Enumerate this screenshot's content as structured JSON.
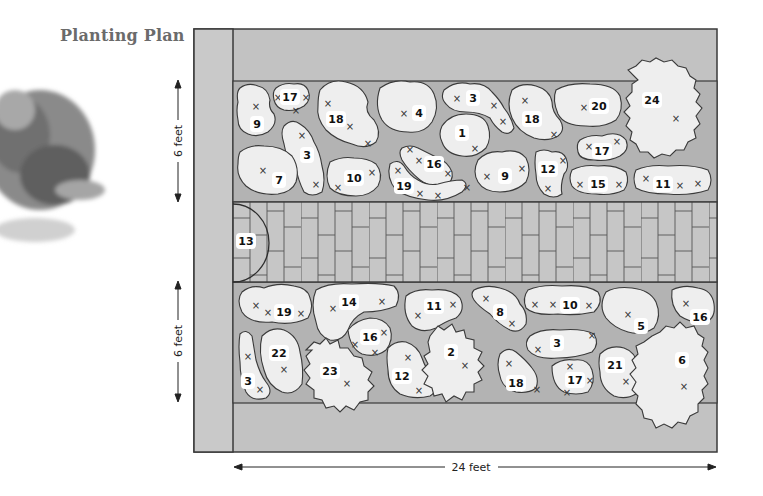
{
  "title": "Planting Plan",
  "colors": {
    "wall": "#c9c9c9",
    "bed_ground": "#b8b8b8",
    "lawn": "#c2c2c2",
    "path": "#c6c6c6",
    "plant_fill": "#eeeeee",
    "outline": "#3a3a3a",
    "title": "#6b6b6b"
  },
  "dimensions": {
    "upper_bed_depth": "6 feet",
    "lower_bed_depth": "6 feet",
    "total_length": "24 feet"
  },
  "path_feature": {
    "number": "13"
  },
  "upper_bed": {
    "plants": [
      {
        "number": "9",
        "x": 257,
        "y": 124
      },
      {
        "number": "17",
        "x": 290,
        "y": 97
      },
      {
        "number": "18",
        "x": 336,
        "y": 119
      },
      {
        "number": "4",
        "x": 419,
        "y": 113
      },
      {
        "number": "3",
        "x": 473,
        "y": 98
      },
      {
        "number": "1",
        "x": 462,
        "y": 133
      },
      {
        "number": "18",
        "x": 532,
        "y": 119
      },
      {
        "number": "20",
        "x": 599,
        "y": 106
      },
      {
        "number": "24",
        "x": 652,
        "y": 100
      },
      {
        "number": "3",
        "x": 307,
        "y": 155
      },
      {
        "number": "7",
        "x": 279,
        "y": 180
      },
      {
        "number": "10",
        "x": 354,
        "y": 178
      },
      {
        "number": "16",
        "x": 434,
        "y": 164
      },
      {
        "number": "19",
        "x": 404,
        "y": 186
      },
      {
        "number": "9",
        "x": 505,
        "y": 176
      },
      {
        "number": "12",
        "x": 548,
        "y": 169
      },
      {
        "number": "17",
        "x": 602,
        "y": 151
      },
      {
        "number": "15",
        "x": 598,
        "y": 184
      },
      {
        "number": "11",
        "x": 663,
        "y": 184
      }
    ]
  },
  "lower_bed": {
    "plants": [
      {
        "number": "19",
        "x": 284,
        "y": 312
      },
      {
        "number": "14",
        "x": 349,
        "y": 302
      },
      {
        "number": "11",
        "x": 434,
        "y": 306
      },
      {
        "number": "8",
        "x": 500,
        "y": 312
      },
      {
        "number": "10",
        "x": 570,
        "y": 305
      },
      {
        "number": "5",
        "x": 641,
        "y": 326
      },
      {
        "number": "16",
        "x": 700,
        "y": 317
      },
      {
        "number": "16",
        "x": 370,
        "y": 337
      },
      {
        "number": "22",
        "x": 279,
        "y": 353
      },
      {
        "number": "2",
        "x": 451,
        "y": 352
      },
      {
        "number": "3",
        "x": 557,
        "y": 343
      },
      {
        "number": "23",
        "x": 330,
        "y": 371
      },
      {
        "number": "12",
        "x": 402,
        "y": 376
      },
      {
        "number": "21",
        "x": 615,
        "y": 365
      },
      {
        "number": "6",
        "x": 682,
        "y": 360
      },
      {
        "number": "3",
        "x": 248,
        "y": 381
      },
      {
        "number": "18",
        "x": 516,
        "y": 383
      },
      {
        "number": "17",
        "x": 575,
        "y": 380
      }
    ]
  }
}
